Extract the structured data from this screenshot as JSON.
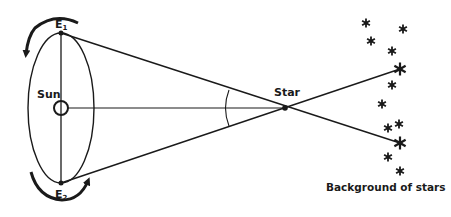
{
  "diagram": {
    "labels": {
      "sun": "Sun",
      "e1": "E",
      "e1_sub": "1",
      "e2": "E",
      "e2_sub": "2",
      "star": "Star",
      "background": "Background of stars"
    },
    "colors": {
      "ink": "#1a1a1a",
      "background": "#ffffff"
    },
    "orbit": {
      "cx": 61,
      "cy": 108,
      "rx": 33,
      "ry": 75
    },
    "sun_pos": {
      "x": 61,
      "y": 108,
      "r": 7
    },
    "e1_pos": {
      "x": 61,
      "y": 33
    },
    "e2_pos": {
      "x": 61,
      "y": 183
    },
    "star_pos": {
      "x": 285,
      "y": 108
    },
    "background_stars": [
      {
        "x": 366,
        "y": 23,
        "size": "small"
      },
      {
        "x": 403,
        "y": 29,
        "size": "small"
      },
      {
        "x": 371,
        "y": 41,
        "size": "small"
      },
      {
        "x": 392,
        "y": 51,
        "size": "small"
      },
      {
        "x": 400,
        "y": 69,
        "size": "large"
      },
      {
        "x": 392,
        "y": 85,
        "size": "small"
      },
      {
        "x": 382,
        "y": 104,
        "size": "small"
      },
      {
        "x": 399,
        "y": 124,
        "size": "small"
      },
      {
        "x": 388,
        "y": 128,
        "size": "small"
      },
      {
        "x": 400,
        "y": 143,
        "size": "large"
      },
      {
        "x": 388,
        "y": 157,
        "size": "small"
      },
      {
        "x": 400,
        "y": 171,
        "size": "small"
      }
    ]
  }
}
